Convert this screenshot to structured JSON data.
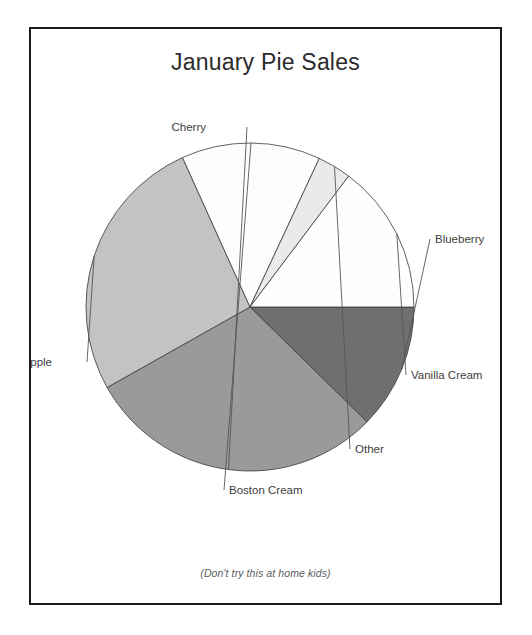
{
  "chart": {
    "title": "January Pie Sales",
    "caption": "(Don't try this at home kids)"
  },
  "chart_data": {
    "type": "pie",
    "title": "January Pie Sales",
    "subtitle": "(Don't try this at home kids)",
    "xlabel": "",
    "ylabel": "",
    "legend_position": "none",
    "labels_position": "outside-with-leader-lines",
    "grid": false,
    "start_angle_deg": 0,
    "direction": "clockwise",
    "categories": [
      "Blueberry",
      "Cherry",
      "Apple",
      "Boston Cream",
      "Other",
      "Vanilla Cream"
    ],
    "values": [
      12.4,
      29.5,
      26.4,
      13.6,
      3.3,
      14.8
    ],
    "units": "percent",
    "slices": [
      {
        "label": "Blueberry",
        "value": 12.4,
        "start_angle_deg": 0,
        "end_angle_deg": 44.5,
        "color": "#6f6f6f",
        "label_x": 435,
        "label_y": 243
      },
      {
        "label": "Cherry",
        "value": 29.5,
        "start_angle_deg": 44.5,
        "end_angle_deg": 150.6,
        "color": "#9a9a9a",
        "label_x": 206,
        "label_y": 131
      },
      {
        "label": "Apple",
        "value": 26.4,
        "start_angle_deg": 150.6,
        "end_angle_deg": 245.7,
        "color": "#c3c3c3",
        "label_x": 52,
        "label_y": 366
      },
      {
        "label": "Boston Cream",
        "value": 13.6,
        "start_angle_deg": 245.7,
        "end_angle_deg": 295.0,
        "color": "#fdfdfd",
        "label_x": 229,
        "label_y": 494
      },
      {
        "label": "Other",
        "value": 3.3,
        "start_angle_deg": 295.0,
        "end_angle_deg": 307.0,
        "color": "#eaeaea",
        "label_x": 355,
        "label_y": 453
      },
      {
        "label": "Vanilla Cream",
        "value": 14.8,
        "start_angle_deg": 307.0,
        "end_angle_deg": 360.0,
        "color": "#fefefe",
        "label_x": 411,
        "label_y": 379
      }
    ],
    "geometry": {
      "center_x": 250,
      "center_y": 307,
      "radius": 164
    },
    "colors": {
      "blueberry": "#6f6f6f",
      "cherry": "#9a9a9a",
      "apple": "#c3c3c3",
      "boston_cream": "#fdfdfd",
      "other": "#eaeaea",
      "vanilla_cream": "#fefefe",
      "outline": "#3a3a3a",
      "frame": "#1a1a1a",
      "text": "#3d3d3d"
    }
  }
}
